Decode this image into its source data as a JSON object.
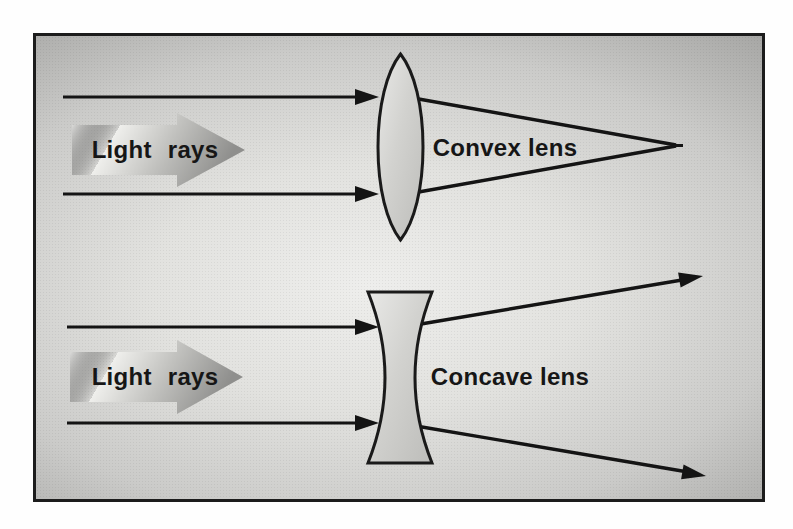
{
  "figure": {
    "type": "optics-lens-diagram",
    "convex_section": {
      "light_rays_label": "Light rays",
      "lens_label": "Convex lens",
      "lens_type": "convex",
      "ray_behavior": "parallel rays converge to a focal point"
    },
    "concave_section": {
      "light_rays_label": "Light rays",
      "lens_label": "Concave lens",
      "lens_type": "concave",
      "ray_behavior": "parallel rays diverge outward"
    },
    "colors": {
      "page_background": "#fefefe",
      "frame_border": "#1c1c1c",
      "frame_background_center": "#eeeeec",
      "frame_background_edge": "#a2a2a0",
      "ray": "#141414",
      "label_text": "#161616",
      "lens_fill_light": "#e8e8e6",
      "lens_fill_dark": "#bfbfbc",
      "block_arrow_light": "#fcfcfa",
      "block_arrow_dark": "#8f8f8d"
    }
  }
}
